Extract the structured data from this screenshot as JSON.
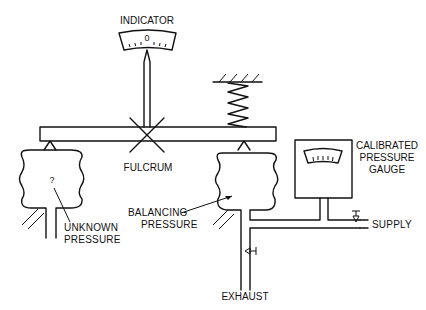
{
  "diagram": {
    "type": "force-balance pressure measurement schematic",
    "labels": {
      "indicator": "INDICATOR",
      "indicator_zero": "0",
      "fulcrum": "FULCRUM",
      "unknown_mark": "?",
      "unknown_pressure_1": "UNKNOWN",
      "unknown_pressure_2": "PRESSURE",
      "balancing_pressure_1": "BALANCING",
      "balancing_pressure_2": "PRESSURE",
      "gauge_1": "CALIBRATED",
      "gauge_2": "PRESSURE",
      "gauge_3": "GAUGE",
      "supply": "SUPPLY",
      "exhaust": "EXHAUST"
    },
    "components": [
      {
        "id": "indicator",
        "label": "INDICATOR"
      },
      {
        "id": "beam",
        "label": ""
      },
      {
        "id": "fulcrum",
        "label": "FULCRUM"
      },
      {
        "id": "spring",
        "label": ""
      },
      {
        "id": "unknown-bellows",
        "label": "UNKNOWN PRESSURE"
      },
      {
        "id": "balancing-bellows",
        "label": "BALANCING PRESSURE"
      },
      {
        "id": "calibrated-gauge",
        "label": "CALIBRATED PRESSURE GAUGE"
      },
      {
        "id": "supply-valve",
        "label": "SUPPLY"
      },
      {
        "id": "exhaust-valve",
        "label": "EXHAUST"
      }
    ],
    "colors": {
      "ink": "#111111",
      "background": "#ffffff"
    }
  }
}
